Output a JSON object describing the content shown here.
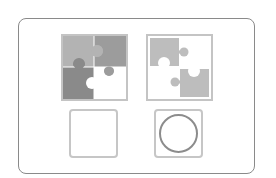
{
  "game": {
    "type": "matching-puzzle",
    "prompt_tiles": [
      {
        "id": "puzzle-complete",
        "description": "four-piece jigsaw puzzle, three gray pieces and one white piece"
      },
      {
        "id": "puzzle-partial",
        "description": "two gray jigsaw pieces on diagonal, two white pieces"
      }
    ],
    "answer_slots": [
      {
        "id": "slot-empty",
        "content": "empty"
      },
      {
        "id": "slot-circle",
        "content": "circle"
      }
    ]
  },
  "colors": {
    "frame_border": "#8a8a8a",
    "tile_border": "#c4c4c4",
    "piece_light": "#b3b3b3",
    "piece_mid": "#9c9c9c",
    "piece_dark": "#8a8a8a",
    "piece_partial": "#bdbdbd",
    "circle_stroke": "#8c8c8c",
    "background": "#ffffff"
  }
}
